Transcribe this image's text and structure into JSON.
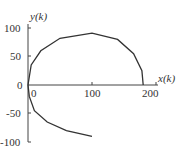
{
  "chart_data": {
    "type": "line",
    "title": "",
    "xlabel": "x(k)",
    "ylabel": "y(k)",
    "x_ticks": [
      "0",
      "100",
      "200"
    ],
    "y_ticks": [
      "-100",
      "-50",
      "0",
      "50",
      "100"
    ],
    "xlim": [
      0,
      200
    ],
    "ylim": [
      -100,
      100
    ],
    "grid": false,
    "series": [
      {
        "name": "trajectory",
        "x": [
          0,
          10,
          30,
          60,
          100,
          140,
          170,
          180
        ],
        "y": [
          -90,
          -60,
          -35,
          -25,
          -90,
          -25,
          -5,
          0
        ],
        "points": [
          [
            100,
            -90
          ],
          [
            60,
            -80
          ],
          [
            30,
            -65
          ],
          [
            10,
            -45
          ],
          [
            2,
            -20
          ],
          [
            0,
            0
          ],
          [
            5,
            35
          ],
          [
            20,
            60
          ],
          [
            50,
            82
          ],
          [
            100,
            91
          ],
          [
            140,
            80
          ],
          [
            165,
            55
          ],
          [
            178,
            25
          ],
          [
            180,
            0
          ]
        ]
      }
    ]
  }
}
